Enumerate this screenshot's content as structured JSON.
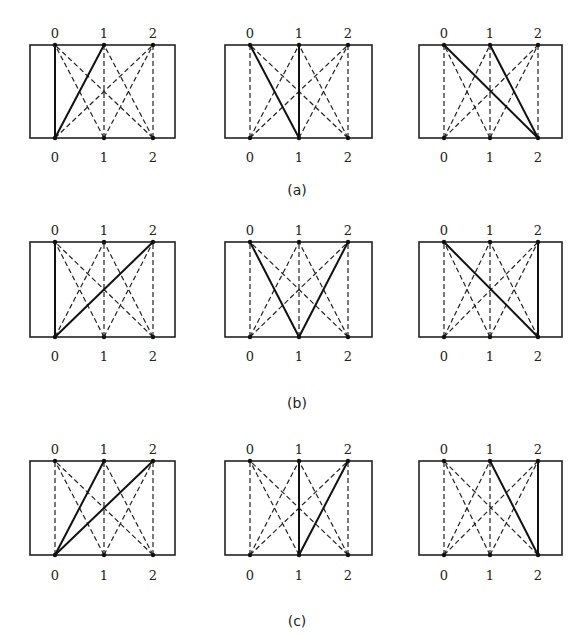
{
  "figure": {
    "node_labels": [
      "0",
      "1",
      "2"
    ],
    "rows": [
      {
        "caption": "(a)",
        "panels": [
          {
            "highlighted_edges": [
              [
                0,
                0
              ],
              [
                0,
                1
              ]
            ]
          },
          {
            "highlighted_edges": [
              [
                1,
                0
              ],
              [
                1,
                1
              ]
            ]
          },
          {
            "highlighted_edges": [
              [
                2,
                0
              ],
              [
                2,
                1
              ]
            ]
          }
        ]
      },
      {
        "caption": "(b)",
        "panels": [
          {
            "highlighted_edges": [
              [
                0,
                0
              ],
              [
                0,
                2
              ]
            ]
          },
          {
            "highlighted_edges": [
              [
                1,
                0
              ],
              [
                1,
                2
              ]
            ]
          },
          {
            "highlighted_edges": [
              [
                2,
                0
              ],
              [
                2,
                2
              ]
            ]
          }
        ]
      },
      {
        "caption": "(c)",
        "panels": [
          {
            "highlighted_edges": [
              [
                0,
                1
              ],
              [
                0,
                2
              ]
            ]
          },
          {
            "highlighted_edges": [
              [
                1,
                1
              ],
              [
                1,
                2
              ]
            ]
          },
          {
            "highlighted_edges": [
              [
                2,
                1
              ],
              [
                2,
                2
              ]
            ]
          }
        ]
      }
    ],
    "edge_note": "Each panel: complete bipartite graph between bottom nodes 0,1,2 and top nodes 0,1,2 drawn dashed; highlighted_edges [bottom, top] drawn solid."
  }
}
